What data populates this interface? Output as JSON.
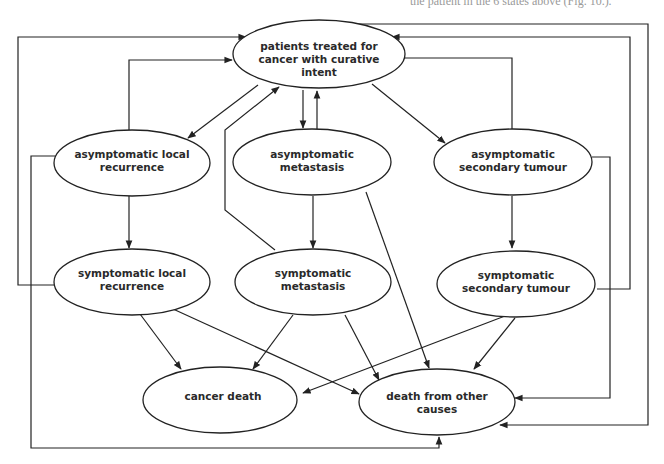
{
  "caption_fragment": "the patient in the 6 states above (Fig. 10.).",
  "nodes": [
    {
      "id": "treated",
      "lines": [
        "patients treated for",
        "cancer with curative",
        "intent"
      ]
    },
    {
      "id": "asym_local",
      "lines": [
        "asymptomatic local",
        "recurrence"
      ]
    },
    {
      "id": "asym_meta",
      "lines": [
        "asymptomatic",
        "metastasis"
      ]
    },
    {
      "id": "asym_second",
      "lines": [
        "asymptomatic",
        "secondary tumour"
      ]
    },
    {
      "id": "sym_local",
      "lines": [
        "symptomatic local",
        "recurrence"
      ]
    },
    {
      "id": "sym_meta",
      "lines": [
        "symptomatic",
        "metastasis"
      ]
    },
    {
      "id": "sym_second",
      "lines": [
        "symptomatic",
        "secondary tumour"
      ]
    },
    {
      "id": "cancer_death",
      "lines": [
        "cancer death"
      ]
    },
    {
      "id": "other_death",
      "lines": [
        "death from other",
        "causes"
      ]
    }
  ],
  "edges": [
    {
      "from": "treated",
      "to": "asym_local"
    },
    {
      "from": "asym_local",
      "to": "treated"
    },
    {
      "from": "treated",
      "to": "asym_meta"
    },
    {
      "from": "asym_meta",
      "to": "treated"
    },
    {
      "from": "treated",
      "to": "asym_second"
    },
    {
      "from": "asym_second",
      "to": "treated"
    },
    {
      "from": "asym_local",
      "to": "sym_local"
    },
    {
      "from": "asym_meta",
      "to": "sym_meta"
    },
    {
      "from": "asym_second",
      "to": "sym_second"
    },
    {
      "from": "sym_local",
      "to": "treated"
    },
    {
      "from": "sym_meta",
      "to": "treated"
    },
    {
      "from": "sym_second",
      "to": "treated"
    },
    {
      "from": "asym_local",
      "to": "other_death"
    },
    {
      "from": "asym_meta",
      "to": "other_death"
    },
    {
      "from": "asym_second",
      "to": "other_death"
    },
    {
      "from": "sym_local",
      "to": "cancer_death"
    },
    {
      "from": "sym_local",
      "to": "other_death"
    },
    {
      "from": "sym_meta",
      "to": "cancer_death"
    },
    {
      "from": "sym_meta",
      "to": "other_death"
    },
    {
      "from": "sym_second",
      "to": "cancer_death"
    },
    {
      "from": "sym_second",
      "to": "other_death"
    },
    {
      "from": "other_death_top_right",
      "to": "treated"
    }
  ]
}
